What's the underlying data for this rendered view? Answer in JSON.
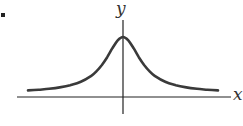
{
  "chart_data": {
    "type": "line",
    "title": "",
    "xlabel": "x",
    "ylabel": "y",
    "grid": false,
    "legend": null,
    "xlim": [
      -5,
      5
    ],
    "ylim": [
      0,
      1.1
    ],
    "x": [
      -4.5,
      -4,
      -3.5,
      -3,
      -2.5,
      -2,
      -1.5,
      -1.25,
      -1,
      -0.75,
      -0.5,
      -0.25,
      0,
      0.25,
      0.5,
      0.75,
      1,
      1.25,
      1.5,
      2,
      2.5,
      3,
      3.5,
      4,
      4.5
    ],
    "series": [
      {
        "name": "f(x)",
        "values": [
          0.047,
          0.059,
          0.075,
          0.1,
          0.138,
          0.2,
          0.308,
          0.39,
          0.5,
          0.64,
          0.8,
          0.941,
          1.0,
          0.941,
          0.8,
          0.64,
          0.5,
          0.39,
          0.308,
          0.2,
          0.138,
          0.1,
          0.075,
          0.059,
          0.047
        ]
      }
    ]
  },
  "figure": {
    "x_axis_label": "x",
    "y_axis_label": "y",
    "bullet": "•",
    "colors": {
      "curve": "#3a3a3a",
      "axes": "#222222",
      "background": "#ffffff"
    }
  }
}
